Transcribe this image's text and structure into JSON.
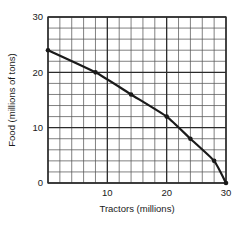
{
  "chart_data": {
    "type": "line",
    "title": "",
    "subtitle": "",
    "xlabel": "Tractors (millions)",
    "ylabel": "Food (millions of tons)",
    "xlim": [
      0,
      30
    ],
    "ylim": [
      0,
      30
    ],
    "xticks": [
      10,
      20,
      30
    ],
    "xtick_labels": [
      "10",
      "20",
      "30"
    ],
    "yticks": [
      0,
      10,
      20,
      30
    ],
    "ytick_labels": [
      "0",
      "10",
      "20",
      "30"
    ],
    "grid": true,
    "grid_minor_step": 2,
    "grid_major_step": 10,
    "legend": "none",
    "x": [
      0,
      8,
      14,
      20,
      24,
      28,
      30
    ],
    "values": [
      24,
      20,
      16,
      12,
      8,
      4,
      0
    ],
    "series": [
      {
        "name": "Production possibilities frontier",
        "x": [
          0,
          8,
          14,
          20,
          24,
          28,
          30
        ],
        "values": [
          24,
          20,
          16,
          12,
          8,
          4,
          0
        ],
        "color": "#1a1a1a",
        "marker": "circle",
        "line_width": 2.2
      }
    ],
    "points": [
      {
        "x": 0,
        "y": 24
      },
      {
        "x": 8,
        "y": 20
      },
      {
        "x": 14,
        "y": 16
      },
      {
        "x": 20,
        "y": 12
      },
      {
        "x": 24,
        "y": 8
      },
      {
        "x": 28,
        "y": 4
      },
      {
        "x": 30,
        "y": 0
      }
    ],
    "annotations": []
  },
  "axes": {
    "x_title": "Tractors (millions)",
    "y_title": "Food (millions of tons)",
    "x_labels": [
      {
        "value": 10,
        "text": "10"
      },
      {
        "value": 20,
        "text": "20"
      },
      {
        "value": 30,
        "text": "30"
      }
    ],
    "y_labels": [
      {
        "value": 0,
        "text": "0"
      },
      {
        "value": 10,
        "text": "10"
      },
      {
        "value": 20,
        "text": "20"
      },
      {
        "value": 30,
        "text": "30"
      }
    ]
  },
  "colors": {
    "curve": "#1a1a1a",
    "grid_minor": "#555555",
    "grid_major": "#2b2b2b",
    "axis": "#1a1a1a",
    "text": "#1a1a1a",
    "background": "#ffffff"
  },
  "labels": {
    "y_top": "30",
    "y_mid_upper": "20",
    "y_mid_lower": "10",
    "y_zero": "0",
    "x_ten": "10",
    "x_twenty": "20",
    "x_thirty": "30",
    "x_axis_title": "Tractors (millions)",
    "y_axis_title": "Food (millions of tons)"
  }
}
